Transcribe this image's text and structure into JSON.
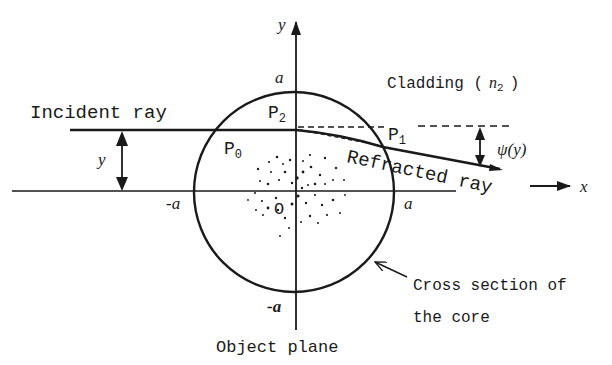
{
  "figure": {
    "axes": {
      "x_label": "x",
      "y_label": "y"
    },
    "core": {
      "radius_label_top": "a",
      "radius_label_bottom": "-a",
      "radius_label_left": "-a",
      "radius_label_right": "a",
      "origin_label": "O",
      "caption_line1": "Cross section of",
      "caption_line2": "the core"
    },
    "cladding_label": "Cladding (",
    "cladding_index": "n",
    "cladding_index_sub": "2",
    "cladding_close": ")",
    "incident_ray_label": "Incident ray",
    "refracted_ray_label": "Refracted ray",
    "offset_label": "y",
    "deflection_label": "ψ(y)",
    "points": {
      "p0": "P",
      "p0_sub": "0",
      "p1": "P",
      "p1_sub": "1",
      "p2": "P",
      "p2_sub": "2"
    },
    "bottom_caption": "Object plane"
  },
  "colors": {
    "ink": "#1a1a1a",
    "background": "#ffffff"
  }
}
